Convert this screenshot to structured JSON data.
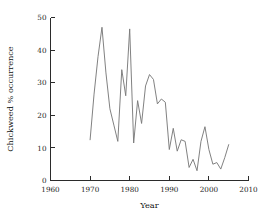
{
  "chart_data": {
    "type": "line",
    "title": "",
    "xlabel": "Year",
    "ylabel": "Chickweed % occurrence",
    "xlim": [
      1960,
      2010
    ],
    "ylim": [
      0,
      50
    ],
    "xticks": [
      1960,
      1970,
      1980,
      1990,
      2000,
      2010
    ],
    "xtick_labels": [
      "1960",
      "1970",
      "1980",
      "1990",
      "2000",
      "2010"
    ],
    "yticks": [
      0,
      10,
      20,
      30,
      40,
      50
    ],
    "ytick_labels": [
      "0",
      "10",
      "20",
      "30",
      "40",
      "50"
    ],
    "grid": false,
    "legend": false,
    "line_color": "#7a7a7a",
    "axis_color": "#2b2b2b",
    "series": [
      {
        "name": "Chickweed % occurrence",
        "x": [
          1970,
          1971,
          1972,
          1973,
          1974,
          1975,
          1976,
          1977,
          1978,
          1979,
          1980,
          1981,
          1982,
          1983,
          1984,
          1985,
          1986,
          1987,
          1988,
          1989,
          1990,
          1991,
          1992,
          1993,
          1994,
          1995,
          1996,
          1997,
          1998,
          1999,
          2000,
          2001,
          2002,
          2003,
          2004,
          2005
        ],
        "values": [
          12.5,
          26.5,
          38.0,
          47.0,
          33.0,
          22.0,
          17.0,
          12.0,
          34.0,
          26.0,
          46.5,
          11.5,
          24.5,
          17.5,
          29.0,
          32.5,
          31.0,
          23.5,
          25.0,
          24.0,
          9.5,
          16.0,
          9.0,
          12.5,
          12.0,
          4.0,
          6.5,
          3.0,
          12.0,
          16.5,
          9.5,
          5.0,
          5.5,
          3.5,
          7.0,
          11.0
        ]
      }
    ]
  },
  "axes": {
    "x_title": "Year",
    "y_title": "Chickweed % occurrence"
  }
}
